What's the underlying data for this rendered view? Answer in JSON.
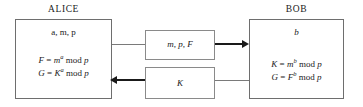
{
  "diagram": {
    "title_alice": "ALICE",
    "title_bob": "BOB",
    "alice": {
      "secrets": "a, m, p",
      "formula1_lhs": "F",
      "formula1_base": "m",
      "formula1_exp": "a",
      "formula1_mod": "mod",
      "formula1_modulus": "p",
      "formula2_lhs": "G",
      "formula2_base": "K",
      "formula2_exp": "a",
      "formula2_mod": "mod",
      "formula2_modulus": "p",
      "formula1_full": "F = m^a mod p",
      "formula2_full": "G = K^a mod p"
    },
    "bob": {
      "secrets": "b",
      "formula1_lhs": "K",
      "formula1_base": "m",
      "formula1_exp": "b",
      "formula1_mod": "mod",
      "formula1_modulus": "p",
      "formula2_lhs": "G",
      "formula2_base": "F",
      "formula2_exp": "b",
      "formula2_mod": "mod",
      "formula2_modulus": "p",
      "formula1_full": "K = m^b mod p",
      "formula2_full": "G = F^b mod p"
    },
    "messages": {
      "alice_to_bob": "m, p, F",
      "bob_to_alice": "K"
    },
    "colors": {
      "box_stroke": "#6e6e6e",
      "msg_stroke": "#8a8a8a",
      "line": "#7a7a7a",
      "arrow": "#1a1a1a",
      "text": "#1a1a1a",
      "background": "#ffffff"
    }
  }
}
